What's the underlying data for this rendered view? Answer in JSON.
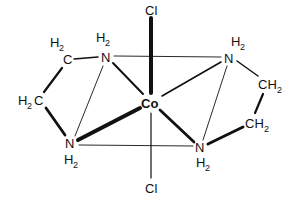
{
  "diagram": {
    "type": "chemical-structure",
    "molecule": "trans-dichlorobis(ethylenediamine)cobalt",
    "center_atom": {
      "label": "Co"
    },
    "axial_ligands": [
      {
        "label": "Cl",
        "position": "top"
      },
      {
        "label": "Cl",
        "position": "bottom"
      }
    ],
    "nitrogens": [
      {
        "label": "N",
        "h": "H",
        "h_sub": "2",
        "position": "top-left"
      },
      {
        "label": "N",
        "h": "H",
        "h_sub": "2",
        "position": "top-right"
      },
      {
        "label": "N",
        "h": "H",
        "h_sub": "2",
        "position": "bottom-left"
      },
      {
        "label": "N",
        "h": "H",
        "h_sub": "2",
        "position": "bottom-right"
      }
    ],
    "carbons": [
      {
        "pre": "H",
        "sub": "2",
        "post": "C",
        "position": "left-upper",
        "layout": "H2 above C"
      },
      {
        "pre": "H",
        "sub": "2",
        "post": "C",
        "position": "left-lower"
      },
      {
        "pre": "CH",
        "sub": "2",
        "position": "right-upper"
      },
      {
        "pre": "CH",
        "sub": "2",
        "position": "right-lower"
      }
    ],
    "colors": {
      "ink": "#111111",
      "background": "#ffffff"
    }
  }
}
